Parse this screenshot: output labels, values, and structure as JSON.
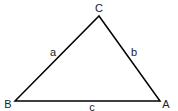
{
  "diagram": {
    "type": "triangle",
    "vertices": [
      {
        "label": "A",
        "x": 160,
        "y": 101,
        "label_x": 166,
        "label_y": 108
      },
      {
        "label": "B",
        "x": 15,
        "y": 101,
        "label_x": 8,
        "label_y": 108
      },
      {
        "label": "C",
        "x": 99,
        "y": 16,
        "label_x": 99,
        "label_y": 12
      }
    ],
    "sides": [
      {
        "label": "a",
        "from": "B",
        "to": "C",
        "label_x": 53,
        "label_y": 56
      },
      {
        "label": "b",
        "from": "C",
        "to": "A",
        "label_x": 134,
        "label_y": 56
      },
      {
        "label": "c",
        "from": "B",
        "to": "A",
        "label_x": 92,
        "label_y": 111
      }
    ],
    "stroke_color": "#000000",
    "label_color": "#222222"
  }
}
